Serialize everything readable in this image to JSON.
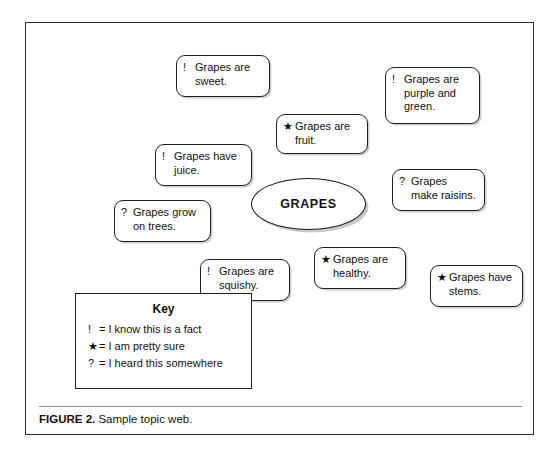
{
  "figure": {
    "caption_label": "FIGURE 2.",
    "caption_text": "Sample topic web.",
    "border_color": "#2b2b2b"
  },
  "topic_web": {
    "center": {
      "label": "GRAPES",
      "shape": "ellipse"
    },
    "bubbles": [
      {
        "marker": "!",
        "text": "Grapes are sweet.",
        "x": 150,
        "y": 32,
        "w": 94,
        "h": 42
      },
      {
        "marker": "!",
        "text": "Grapes are purple and green.",
        "x": 359,
        "y": 44,
        "w": 95,
        "h": 57
      },
      {
        "marker": "★",
        "text": "Grapes are fruit.",
        "x": 250,
        "y": 91,
        "w": 92,
        "h": 40
      },
      {
        "marker": "!",
        "text": "Grapes have juice.",
        "x": 129,
        "y": 121,
        "w": 97,
        "h": 42
      },
      {
        "marker": "?",
        "text": "Grapes make raisins.",
        "x": 366,
        "y": 146,
        "w": 93,
        "h": 42
      },
      {
        "marker": "?",
        "text": "Grapes grow on trees.",
        "x": 88,
        "y": 177,
        "w": 97,
        "h": 42
      },
      {
        "marker": "!",
        "text": "Grapes are squishy.",
        "x": 174,
        "y": 236,
        "w": 90,
        "h": 42
      },
      {
        "marker": "★",
        "text": "Grapes are healthy.",
        "x": 288,
        "y": 224,
        "w": 92,
        "h": 42
      },
      {
        "marker": "★",
        "text": "Grapes have stems.",
        "x": 404,
        "y": 242,
        "w": 93,
        "h": 42
      }
    ]
  },
  "key": {
    "title": "Key",
    "entries": [
      {
        "symbol": "!",
        "equals": "=",
        "meaning": "I know this is a fact"
      },
      {
        "symbol": "★",
        "equals": "=",
        "meaning": "I am pretty sure"
      },
      {
        "symbol": "?",
        "equals": "=",
        "meaning": "I heard this somewhere"
      }
    ]
  }
}
